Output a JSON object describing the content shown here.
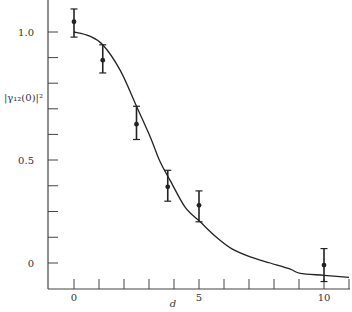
{
  "chart_data": {
    "type": "scatter",
    "title": "",
    "xlabel": "d",
    "ylabel": "|γ₁₂(0)|²",
    "xlim": [
      -1,
      11
    ],
    "ylim": [
      -0.12,
      1.12
    ],
    "grid": false,
    "legend": null,
    "x_ticks": [
      0,
      1,
      2,
      3,
      4,
      5,
      6,
      7,
      8,
      9,
      10,
      11
    ],
    "x_tick_labels": [
      {
        "value": 0,
        "label": "0"
      },
      {
        "value": 5,
        "label": "5"
      },
      {
        "value": 10,
        "label": "10"
      }
    ],
    "y_ticks": [
      1.0,
      0.9,
      0.8,
      0.7,
      0.6,
      0.5,
      0.375,
      0.25,
      0.125,
      0.0
    ],
    "y_tick_labels": [
      {
        "value": 1.0,
        "label": "1.0"
      },
      {
        "value": 0.5,
        "label": "0.5"
      },
      {
        "value": 0.0,
        "label": "0"
      }
    ],
    "series": [
      {
        "name": "measured",
        "kind": "errorbar",
        "points": [
          {
            "x": 0.0,
            "y": 1.04,
            "ylow": 0.98,
            "yhigh": 1.09
          },
          {
            "x": 1.15,
            "y": 0.89,
            "ylow": 0.84,
            "yhigh": 0.95
          },
          {
            "x": 2.5,
            "y": 0.64,
            "ylow": 0.58,
            "yhigh": 0.71
          },
          {
            "x": 3.75,
            "y": 0.37,
            "ylow": 0.3,
            "yhigh": 0.45
          },
          {
            "x": 5.0,
            "y": 0.28,
            "ylow": 0.2,
            "yhigh": 0.35
          },
          {
            "x": 10.0,
            "y": -0.01,
            "ylow": -0.09,
            "yhigh": 0.07
          }
        ]
      },
      {
        "name": "theory",
        "kind": "line",
        "points": [
          {
            "x": 0.0,
            "y": 1.0
          },
          {
            "x": 0.6,
            "y": 0.985
          },
          {
            "x": 1.15,
            "y": 0.95
          },
          {
            "x": 1.85,
            "y": 0.85
          },
          {
            "x": 2.5,
            "y": 0.71
          },
          {
            "x": 3.05,
            "y": 0.59
          },
          {
            "x": 3.45,
            "y": 0.49
          },
          {
            "x": 3.85,
            "y": 0.4
          },
          {
            "x": 4.45,
            "y": 0.27
          },
          {
            "x": 5.05,
            "y": 0.2
          },
          {
            "x": 5.65,
            "y": 0.13
          },
          {
            "x": 6.3,
            "y": 0.07
          },
          {
            "x": 7.05,
            "y": 0.03
          },
          {
            "x": 7.85,
            "y": 0.0
          },
          {
            "x": 8.65,
            "y": -0.03
          },
          {
            "x": 9.05,
            "y": -0.05
          },
          {
            "x": 10.0,
            "y": -0.06
          },
          {
            "x": 11.0,
            "y": -0.07
          }
        ]
      }
    ]
  },
  "colors": {
    "axis": "#444444",
    "series": "#222222",
    "background": "#ffffff"
  }
}
